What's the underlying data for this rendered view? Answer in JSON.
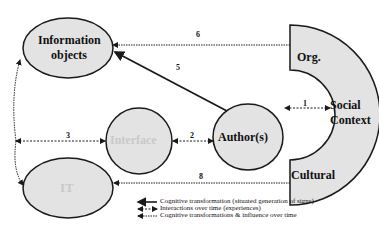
{
  "nodes": {
    "information_objects": {
      "line1": "Information",
      "line2": "objects"
    },
    "interface": {
      "label": "Interface"
    },
    "authors": {
      "label": "Author(s)"
    },
    "it": {
      "label": "IT"
    },
    "social_context": {
      "org": "Org.",
      "social": "Social",
      "context": "Context",
      "cultural": "Cultural"
    }
  },
  "arrows": {
    "a1": "1",
    "a2": "2",
    "a3": "3",
    "a5": "5",
    "a6": "6",
    "a8": "8"
  },
  "legend": {
    "solid": "Cognitive transformation (situated generation of signs)",
    "dashed": "Interactions over time (experiences)",
    "dotted": "Cognitive transformations & influence over time"
  },
  "colors": {
    "node_fill": "#e3e3e3",
    "stroke": "#1a1a1a",
    "faded_text": "#c9c9c9"
  }
}
